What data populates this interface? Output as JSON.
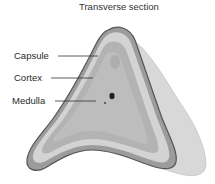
{
  "diagram": {
    "title": "Transverse section",
    "labels": [
      {
        "id": "capsule",
        "text": "Capsule"
      },
      {
        "id": "cortex",
        "text": "Cortex"
      },
      {
        "id": "medulla",
        "text": "Medulla"
      }
    ],
    "colors": {
      "capsule_outline": "#5a5a5a",
      "capsule_band": "#9a9a9a",
      "cortex_outer": "#d2d2d2",
      "cortex_inner": "#b4b4b4",
      "medulla": "#bdbdbd",
      "surrounding_tissue": "#d6d6d6",
      "leader_line": "#333333"
    }
  }
}
